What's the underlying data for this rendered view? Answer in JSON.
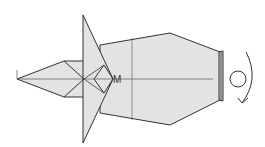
{
  "diagram": {
    "labels": {
      "point_l": "L",
      "point_m": "M"
    },
    "symbols": {
      "turn_over": "rotate-arrow-icon"
    },
    "colors": {
      "paper_fill": "#e3e3e3",
      "line": "#333333",
      "background": "#ffffff"
    }
  }
}
